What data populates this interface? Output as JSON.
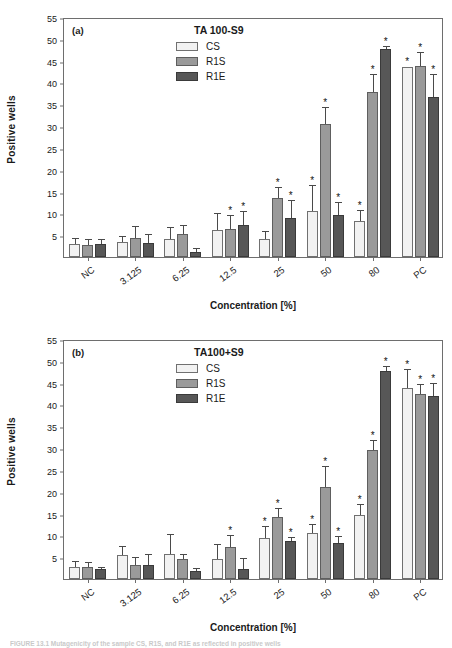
{
  "figure": {
    "caption": "FIGURE 13.1  Mutagenicity of the sample CS, R1S, and R1E as reflected in positive wells"
  },
  "axes": {
    "ylabel": "Positive wells",
    "xlabel": "Concentration [%]",
    "yticks": [
      5,
      10,
      15,
      20,
      25,
      30,
      35,
      40,
      45,
      50,
      55
    ],
    "ylim": [
      0,
      55
    ]
  },
  "legend": {
    "series": [
      {
        "key": "cs",
        "label": "CS",
        "color": "#f2f2f2"
      },
      {
        "key": "r1s",
        "label": "R1S",
        "color": "#9a9a9a"
      },
      {
        "key": "r1e",
        "label": "R1E",
        "color": "#575757"
      }
    ]
  },
  "panels": [
    {
      "tag": "(a)",
      "title": "TA 100-S9"
    },
    {
      "tag": "(b)",
      "title": "TA100+S9"
    }
  ],
  "chart_data": [
    {
      "type": "bar",
      "title": "TA 100-S9",
      "panel": "(a)",
      "xlabel": "Concentration [%]",
      "ylabel": "Positive wells",
      "ylim": [
        0,
        55
      ],
      "grid": false,
      "legend_position": "top-center",
      "categories": [
        "NC",
        "3.125",
        "6.25",
        "12.5",
        "25",
        "50",
        "80",
        "PC"
      ],
      "series": [
        {
          "name": "CS",
          "values": [
            2.9,
            3.5,
            4.2,
            6.2,
            4.1,
            10.6,
            8.2,
            43.6
          ],
          "errors": [
            1.3,
            1.1,
            2.5,
            3.6,
            1.6,
            5.7,
            2.3,
            0.0
          ],
          "significant": [
            false,
            false,
            false,
            false,
            false,
            true,
            true,
            true
          ]
        },
        {
          "name": "R1S",
          "values": [
            2.7,
            4.4,
            5.3,
            6.5,
            13.5,
            30.5,
            37.8,
            43.8
          ],
          "errors": [
            1.3,
            2.4,
            1.8,
            2.9,
            2.4,
            3.6,
            3.8,
            3.0
          ],
          "significant": [
            false,
            false,
            false,
            true,
            true,
            true,
            true,
            true
          ]
        },
        {
          "name": "R1E",
          "values": [
            2.9,
            3.1,
            1.2,
            7.3,
            9.0,
            9.7,
            47.7,
            36.7
          ],
          "errors": [
            1.1,
            1.9,
            0.6,
            3.1,
            3.8,
            2.6,
            0.4,
            5.0
          ],
          "significant": [
            false,
            false,
            false,
            true,
            true,
            true,
            true,
            true
          ]
        }
      ]
    },
    {
      "type": "bar",
      "title": "TA100+S9",
      "panel": "(b)",
      "xlabel": "Concentration [%]",
      "ylabel": "Positive wells",
      "ylim": [
        0,
        55
      ],
      "grid": false,
      "legend_position": "top-center",
      "categories": [
        "NC",
        "3.125",
        "6.25",
        "12.5",
        "25",
        "50",
        "80",
        "PC"
      ],
      "series": [
        {
          "name": "CS",
          "values": [
            2.8,
            5.5,
            5.8,
            4.5,
            9.4,
            10.6,
            14.6,
            43.8
          ],
          "errors": [
            1.0,
            1.9,
            4.4,
            3.4,
            2.5,
            1.8,
            2.4,
            4.0
          ],
          "significant": [
            false,
            false,
            false,
            false,
            true,
            true,
            true,
            true
          ]
        },
        {
          "name": "R1S",
          "values": [
            2.7,
            3.3,
            4.6,
            7.3,
            14.2,
            21.2,
            29.5,
            42.3
          ],
          "errors": [
            1.0,
            1.6,
            0.9,
            2.6,
            1.9,
            4.4,
            2.2,
            2.2
          ],
          "significant": [
            false,
            false,
            false,
            true,
            true,
            true,
            true,
            true
          ]
        },
        {
          "name": "R1E",
          "values": [
            2.2,
            3.1,
            1.8,
            2.2,
            8.7,
            8.3,
            47.6,
            42.0
          ],
          "errors": [
            0.4,
            2.3,
            0.4,
            2.5,
            0.7,
            1.4,
            0.9,
            2.6
          ],
          "significant": [
            false,
            false,
            false,
            false,
            true,
            true,
            true,
            true
          ]
        }
      ]
    }
  ]
}
